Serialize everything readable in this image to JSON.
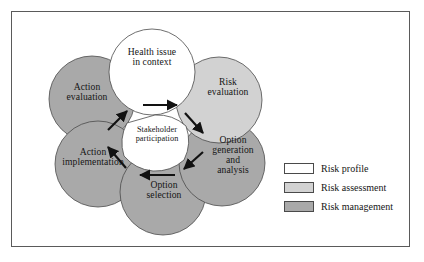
{
  "figure": {
    "border_color": "#5a5a5a",
    "background": "#ffffff"
  },
  "colors": {
    "risk_profile": "#ffffff",
    "risk_assessment": "#d2d2d2",
    "risk_management": "#a9a9a9",
    "outline": "#4a4a4a",
    "text": "#151515",
    "arrow": "#121212"
  },
  "center": {
    "label": "Stakeholder\nparticipation",
    "fill": "#ffffff"
  },
  "nodes": [
    {
      "id": "health-issue-in-context",
      "label": "Health issue\nin context",
      "category": "Risk profile",
      "fill": "#ffffff",
      "cx": 152,
      "cy": 72,
      "r": 43,
      "label_x": 152,
      "label_y": 61
    },
    {
      "id": "risk-evaluation",
      "label": "Risk\nevaluation",
      "category": "Risk assessment",
      "fill": "#d2d2d2",
      "cx": 219,
      "cy": 100,
      "r": 43,
      "label_x": 228,
      "label_y": 89
    },
    {
      "id": "option-generation-and-analysis",
      "label": "Option\ngeneration\nand\nanalysis",
      "category": "Risk management",
      "fill": "#a9a9a9",
      "cx": 222,
      "cy": 163,
      "r": 43,
      "label_x": 232,
      "label_y": 142
    },
    {
      "id": "option-selection",
      "label": "Option\nselection",
      "category": "Risk management",
      "fill": "#a9a9a9",
      "cx": 163,
      "cy": 192,
      "r": 43,
      "label_x": 163,
      "label_y": 186
    },
    {
      "id": "action-implementation",
      "label": "Action\nimplementation",
      "category": "Risk management",
      "fill": "#a9a9a9",
      "cx": 98,
      "cy": 164,
      "r": 43,
      "label_x": 92,
      "label_y": 153
    },
    {
      "id": "action-evaluation",
      "label": "Action\nevaluation",
      "category": "Risk management",
      "fill": "#a9a9a9",
      "cx": 92,
      "cy": 99,
      "r": 43,
      "label_x": 85,
      "label_y": 88
    }
  ],
  "arrows": [
    {
      "id": "arrow-top",
      "from": "health-issue-in-context",
      "to": "risk-evaluation",
      "direction": "right"
    },
    {
      "id": "arrow-upper-right",
      "from": "risk-evaluation",
      "to": "option-generation-and-analysis",
      "direction": "down-right"
    },
    {
      "id": "arrow-lower-right",
      "from": "option-generation-and-analysis",
      "to": "option-selection",
      "direction": "down-left"
    },
    {
      "id": "arrow-bottom",
      "from": "option-selection",
      "to": "action-implementation",
      "direction": "left"
    },
    {
      "id": "arrow-lower-left",
      "from": "action-implementation",
      "to": "action-evaluation",
      "direction": "up-left"
    },
    {
      "id": "arrow-upper-left",
      "from": "action-evaluation",
      "to": "health-issue-in-context",
      "direction": "up-right"
    }
  ],
  "legend": {
    "items": [
      {
        "label": "Risk profile",
        "color": "#ffffff"
      },
      {
        "label": "Risk assessment",
        "color": "#d2d2d2"
      },
      {
        "label": "Risk management",
        "color": "#a9a9a9"
      }
    ]
  }
}
